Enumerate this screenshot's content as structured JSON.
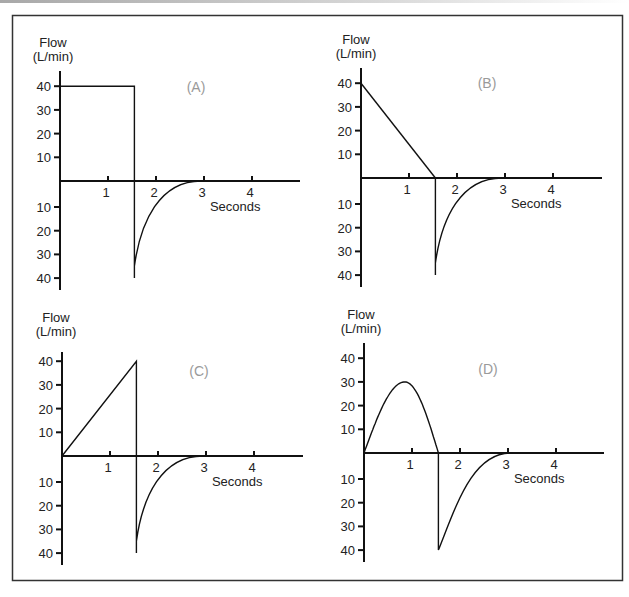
{
  "figure": {
    "frame_color": "#333333",
    "line_color": "#111111",
    "panel_label_color": "#9a9a9a"
  },
  "chart_data": [
    {
      "type": "line",
      "panel": "(A)",
      "title": "(A)",
      "ylabel": "Flow",
      "ylabel_units": "(L/min)",
      "xlabel": "Seconds",
      "x_ticks": [
        "1",
        "2",
        "3",
        "4"
      ],
      "y_ticks_above": [
        "40",
        "30",
        "20",
        "10"
      ],
      "y_ticks_below": [
        "10",
        "20",
        "30",
        "40"
      ],
      "ylim": [
        -40,
        40
      ],
      "xlim": [
        0,
        5
      ],
      "grid": false,
      "description": "Square (constant) inspiratory flow followed by passive exponential expiratory flow",
      "inspiration": {
        "shape": "square",
        "x": [
          0,
          0,
          1.55,
          1.55
        ],
        "y": [
          0,
          40,
          40,
          0
        ]
      },
      "expiration": {
        "shape": "exponential",
        "peak_flow": -40,
        "start_s": 1.55,
        "end_s": 3.0,
        "x": [
          1.55,
          1.6,
          1.8,
          2.0,
          2.25,
          2.5,
          2.75,
          3.0
        ],
        "y": [
          -40,
          -30,
          -20,
          -14,
          -8,
          -4,
          -1.5,
          0
        ]
      }
    },
    {
      "type": "line",
      "panel": "(B)",
      "title": "(B)",
      "ylabel": "Flow",
      "ylabel_units": "(L/min)",
      "xlabel": "Seconds",
      "x_ticks": [
        "1",
        "2",
        "3",
        "4"
      ],
      "y_ticks_above": [
        "40",
        "30",
        "20",
        "10"
      ],
      "y_ticks_below": [
        "10",
        "20",
        "30",
        "40"
      ],
      "ylim": [
        -40,
        40
      ],
      "xlim": [
        0,
        5
      ],
      "grid": false,
      "description": "Decelerating ramp inspiratory flow followed by passive exponential expiratory flow",
      "inspiration": {
        "shape": "decelerating_ramp",
        "x": [
          0,
          1.55
        ],
        "y": [
          40,
          0
        ]
      },
      "expiration": {
        "shape": "exponential",
        "peak_flow": -40,
        "start_s": 1.55,
        "end_s": 3.0,
        "x": [
          1.55,
          1.6,
          1.8,
          2.0,
          2.25,
          2.5,
          2.75,
          3.0
        ],
        "y": [
          -40,
          -30,
          -20,
          -14,
          -8,
          -4,
          -1.5,
          0
        ]
      }
    },
    {
      "type": "line",
      "panel": "(C)",
      "title": "(C)",
      "ylabel": "Flow",
      "ylabel_units": "(L/min)",
      "xlabel": "Seconds",
      "x_ticks": [
        "1",
        "2",
        "3",
        "4"
      ],
      "y_ticks_above": [
        "40",
        "30",
        "20",
        "10"
      ],
      "y_ticks_below": [
        "10",
        "20",
        "30",
        "40"
      ],
      "ylim": [
        -40,
        40
      ],
      "xlim": [
        0,
        5
      ],
      "grid": false,
      "description": "Accelerating ramp inspiratory flow followed by passive exponential expiratory flow",
      "inspiration": {
        "shape": "accelerating_ramp",
        "x": [
          0,
          1.55,
          1.55
        ],
        "y": [
          0,
          40,
          0
        ]
      },
      "expiration": {
        "shape": "exponential",
        "peak_flow": -40,
        "start_s": 1.55,
        "end_s": 3.0,
        "x": [
          1.55,
          1.6,
          1.8,
          2.0,
          2.25,
          2.5,
          2.75,
          3.0
        ],
        "y": [
          -40,
          -30,
          -20,
          -14,
          -8,
          -4,
          -1.5,
          0
        ]
      }
    },
    {
      "type": "line",
      "panel": "(D)",
      "title": "(D)",
      "ylabel": "Flow",
      "ylabel_units": "(L/min)",
      "xlabel": "Seconds",
      "x_ticks": [
        "1",
        "2",
        "3",
        "4"
      ],
      "y_ticks_above": [
        "40",
        "30",
        "20",
        "10"
      ],
      "y_ticks_below": [
        "10",
        "20",
        "30",
        "40"
      ],
      "ylim": [
        -40,
        40
      ],
      "xlim": [
        0,
        5
      ],
      "grid": false,
      "description": "Sinusoidal inspiratory flow (peak 30 L/min) followed by passive exponential expiratory flow",
      "inspiration": {
        "shape": "sine",
        "peak_flow": 30,
        "peak_time_s": 0.85,
        "x": [
          0,
          0.2,
          0.4,
          0.6,
          0.85,
          1.1,
          1.3,
          1.45,
          1.55
        ],
        "y": [
          0,
          14,
          23,
          28.5,
          30,
          27,
          19,
          10,
          0
        ]
      },
      "expiration": {
        "shape": "exponential",
        "peak_flow": -40,
        "start_s": 1.55,
        "end_s": 3.1,
        "x": [
          1.55,
          1.8,
          2.0,
          2.25,
          2.5,
          2.75,
          3.0,
          3.1
        ],
        "y": [
          -40,
          -28,
          -19,
          -11,
          -6,
          -2.5,
          -0.5,
          0
        ]
      }
    }
  ]
}
